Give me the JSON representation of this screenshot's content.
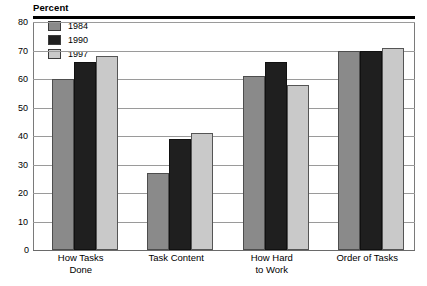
{
  "chart_data": {
    "type": "bar",
    "title": "Percent",
    "xlabel": "",
    "ylabel": "Percent",
    "ylim": [
      0,
      80
    ],
    "yticks": [
      0,
      10,
      20,
      30,
      40,
      50,
      60,
      70,
      80
    ],
    "ytick_labels": [
      "0",
      "10",
      "20",
      "30",
      "40",
      "50",
      "60",
      "70",
      "80"
    ],
    "grid": true,
    "legend_position": "top-left",
    "categories": [
      "How Tasks Done",
      "Task Content",
      "How Hard to Work",
      "Order of Tasks"
    ],
    "category_lines": [
      [
        "How Tasks",
        "Done"
      ],
      [
        "Task Content",
        ""
      ],
      [
        "How Hard",
        "to Work"
      ],
      [
        "Order of Tasks",
        ""
      ]
    ],
    "series": [
      {
        "name": "1984",
        "color": "#8a8a8a",
        "values": [
          60,
          27,
          61,
          70
        ]
      },
      {
        "name": "1990",
        "color": "#1f1f1f",
        "values": [
          66,
          39,
          66,
          70
        ]
      },
      {
        "name": "1997",
        "color": "#c9c9c9",
        "values": [
          68,
          41,
          58,
          71
        ]
      }
    ]
  },
  "legend": {
    "items": [
      {
        "label": "1984",
        "swatch": "#8a8a8a"
      },
      {
        "label": "1990",
        "swatch": "#1f1f1f"
      },
      {
        "label": "1997",
        "swatch": "#c9c9c9"
      }
    ]
  },
  "colors": {
    "series_1984": "#8a8a8a",
    "series_1990": "#1f1f1f",
    "series_1997": "#c9c9c9",
    "gridline": "#9a9a9a",
    "rule": "#000000",
    "text": "#000000",
    "background": "#ffffff"
  }
}
